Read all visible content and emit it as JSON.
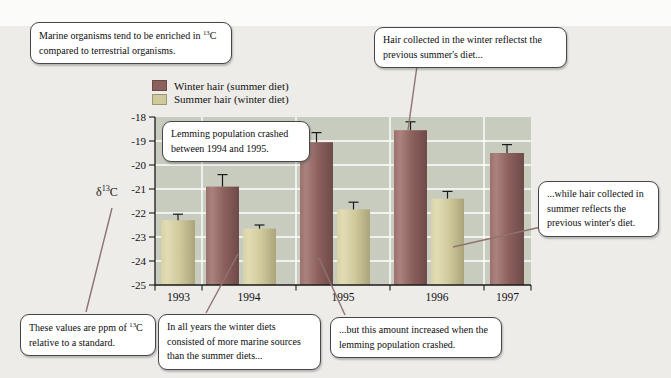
{
  "colors": {
    "winter_bar": "#8c605d",
    "summer_bar": "#d0c99c",
    "plot_bg": "#c7ccbf",
    "grid": "#ffffff",
    "leader_line": "#8e7370",
    "box_border": "#474747",
    "page_bg": "#edece9"
  },
  "legend": {
    "items": [
      {
        "label": "Winter hair (summer diet)",
        "color": "#8c605d"
      },
      {
        "label": "Summer hair (winter diet)",
        "color": "#d0c99c"
      }
    ]
  },
  "y_axis_label": {
    "pre": "δ",
    "sup": "13",
    "post": "C"
  },
  "annotations": {
    "marine": {
      "pre": "Marine organisms tend to be enriched in ",
      "sup": "13",
      "post": "C compared to terrestrial organisms."
    },
    "winter_hair": {
      "text": "Hair collected in the winter reflectst the previous summer's diet..."
    },
    "lemming_crash": {
      "text": "Lemming population crashed between 1994 and 1995."
    },
    "summer_hair": {
      "text": "...while hair collected in summer reflects the previous winter's diet."
    },
    "ppm": {
      "pre": "These values are ppm of ",
      "sup": "13",
      "post": "C relative to a standard."
    },
    "winter_diets": {
      "text": "In all years the winter diets consisted of more marine sources than the summer diets..."
    },
    "increase": {
      "text": "...but this amount increased when the lemming population crashed."
    }
  },
  "chart_data": {
    "type": "bar",
    "categories": [
      "1993",
      "1994",
      "1995",
      "1996",
      "1997"
    ],
    "series": [
      {
        "name": "Winter hair (summer diet)",
        "values": [
          null,
          -20.9,
          -19.05,
          -18.55,
          -19.5
        ],
        "errors": [
          null,
          0.5,
          0.4,
          0.35,
          0.35
        ],
        "color": "#8c605d"
      },
      {
        "name": "Summer hair (winter diet)",
        "values": [
          -22.3,
          -22.65,
          -21.85,
          -21.4,
          null
        ],
        "errors": [
          0.25,
          0.15,
          0.3,
          0.3,
          null
        ],
        "color": "#d0c99c"
      }
    ],
    "title": "",
    "xlabel": "",
    "ylabel": "δ13C",
    "ylim": [
      -25,
      -18
    ],
    "yticks": [
      -18,
      -19,
      -20,
      -21,
      -22,
      -23,
      -24,
      -25
    ],
    "grid": true,
    "grid_color": "#ffffff",
    "legend_position": "top-left above plot"
  }
}
